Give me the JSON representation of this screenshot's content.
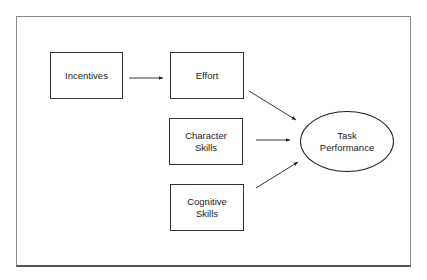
{
  "diagram": {
    "nodes": [
      {
        "id": "incentives",
        "label": "Incentives",
        "shape": "rect"
      },
      {
        "id": "effort",
        "label": "Effort",
        "shape": "rect"
      },
      {
        "id": "character_skills",
        "label": "Character\nSkills",
        "shape": "rect"
      },
      {
        "id": "cognitive_skills",
        "label": "Cognitive\nSkills",
        "shape": "rect"
      },
      {
        "id": "task_performance",
        "label": "Task\nPerformance",
        "shape": "ellipse"
      }
    ],
    "edges": [
      {
        "from": "incentives",
        "to": "effort"
      },
      {
        "from": "effort",
        "to": "task_performance"
      },
      {
        "from": "character_skills",
        "to": "task_performance"
      },
      {
        "from": "cognitive_skills",
        "to": "task_performance"
      }
    ],
    "labels": {
      "incentives": "Incentives",
      "effort": "Effort",
      "character_l1": "Character",
      "character_l2": "Skills",
      "cognitive_l1": "Cognitive",
      "cognitive_l2": "Skills",
      "task_l1": "Task",
      "task_l2": "Performance"
    }
  }
}
